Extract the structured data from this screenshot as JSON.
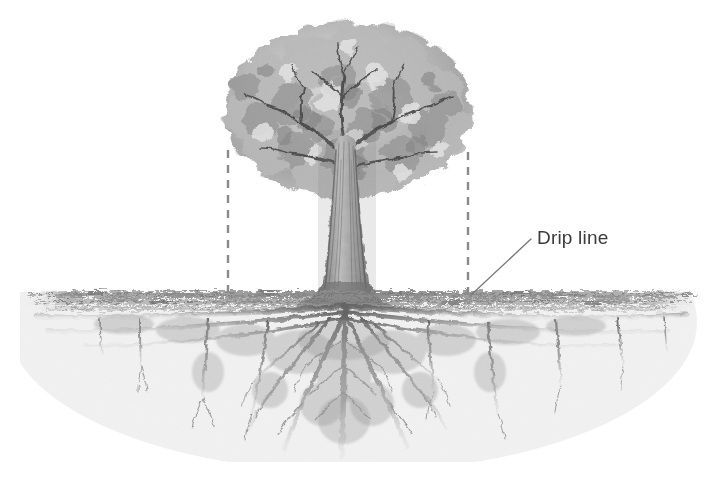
{
  "figure": {
    "type": "pencil-illustration",
    "background_color": "#ffffff",
    "width": 718,
    "height": 483
  },
  "annotations": {
    "drip_line_label": {
      "text": "Drip line",
      "color": "#3b3b3b",
      "font_size_px": 19,
      "x": 537,
      "y": 227
    }
  },
  "leader_line": {
    "name": "drip-line-leader",
    "from": [
      470,
      296
    ],
    "to": [
      531,
      239
    ],
    "color": "#7a7a7a",
    "width_px": 1.4
  },
  "drip_line_markers": [
    {
      "name": "left-drip-line",
      "x": 228,
      "y_top": 150,
      "y_bottom": 297,
      "style": "dashed",
      "color": "#8a8a8a"
    },
    {
      "name": "right-drip-line",
      "x": 468,
      "y_top": 152,
      "y_bottom": 297,
      "style": "dashed",
      "color": "#8a8a8a"
    }
  ],
  "tree": {
    "canopy": {
      "center_x": 348,
      "center_y": 108,
      "radius_x": 122,
      "radius_y": 86,
      "top_y": 25,
      "left_x": 228,
      "right_x": 470,
      "bottom_y": 196,
      "tone_light": "#d8d8d8",
      "tone_mid": "#b4b4b4",
      "tone_dark": "#8d8d8d"
    },
    "trunk": {
      "center_x": 345,
      "top_y": 120,
      "base_y": 300,
      "width_top_px": 16,
      "width_base_px": 34,
      "tone": "#6e6e6e"
    },
    "ground_line": {
      "y": 296,
      "x_start": 22,
      "x_end": 702,
      "band_height_px": 18,
      "tone": "#9a9a9a"
    },
    "roots": {
      "spread_x_start": 30,
      "spread_x_end": 700,
      "deepest_y": 458,
      "taproot_x": 345,
      "tone": "#8f8f8f",
      "tone_dark": "#5c5c5c"
    }
  },
  "palette": {
    "ink": "#3b3b3b",
    "graphite_light": "#d9d9d9",
    "graphite_mid": "#a8a8a8",
    "graphite_dark": "#6b6b6b",
    "dash": "#8a8a8a",
    "white": "#ffffff"
  }
}
